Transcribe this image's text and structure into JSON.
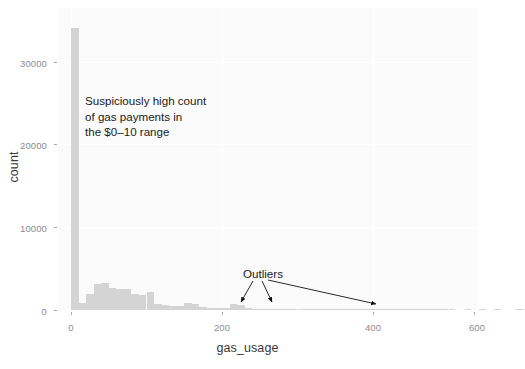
{
  "chart_data": {
    "type": "bar",
    "title": "",
    "subtitle": "",
    "xlabel": "gas_usage",
    "ylabel": "count",
    "xlim": [
      -20,
      620
    ],
    "ylim": [
      0,
      35000
    ],
    "xticks": [
      0,
      200,
      400,
      600
    ],
    "xtick_labels": [
      "0",
      "200",
      "400",
      "600"
    ],
    "yticks": [
      0,
      10000,
      20000,
      30000
    ],
    "ytick_labels": [
      "0",
      "10000",
      "20000",
      "30000"
    ],
    "grid": true,
    "legend": "none",
    "bin_width": 10,
    "bar_color": "#d4d4d4",
    "panel_color": "#fbfbfb",
    "bins": [
      {
        "x": 0,
        "value": 34100
      },
      {
        "x": 10,
        "value": 900
      },
      {
        "x": 20,
        "value": 1900
      },
      {
        "x": 30,
        "value": 3100
      },
      {
        "x": 40,
        "value": 3300
      },
      {
        "x": 50,
        "value": 2700
      },
      {
        "x": 60,
        "value": 2600
      },
      {
        "x": 70,
        "value": 2500
      },
      {
        "x": 80,
        "value": 1900
      },
      {
        "x": 90,
        "value": 1800
      },
      {
        "x": 100,
        "value": 2200
      },
      {
        "x": 110,
        "value": 700
      },
      {
        "x": 120,
        "value": 600
      },
      {
        "x": 130,
        "value": 500
      },
      {
        "x": 140,
        "value": 450
      },
      {
        "x": 150,
        "value": 800
      },
      {
        "x": 160,
        "value": 750
      },
      {
        "x": 170,
        "value": 350
      },
      {
        "x": 180,
        "value": 300
      },
      {
        "x": 190,
        "value": 250
      },
      {
        "x": 200,
        "value": 250
      },
      {
        "x": 210,
        "value": 700
      },
      {
        "x": 220,
        "value": 600
      },
      {
        "x": 230,
        "value": 200
      },
      {
        "x": 240,
        "value": 150
      },
      {
        "x": 250,
        "value": 120
      },
      {
        "x": 260,
        "value": 100
      },
      {
        "x": 270,
        "value": 80
      },
      {
        "x": 280,
        "value": 70
      },
      {
        "x": 290,
        "value": 60
      },
      {
        "x": 300,
        "value": 50
      },
      {
        "x": 310,
        "value": 40
      },
      {
        "x": 320,
        "value": 30
      },
      {
        "x": 330,
        "value": 25
      },
      {
        "x": 340,
        "value": 20
      },
      {
        "x": 350,
        "value": 15
      },
      {
        "x": 360,
        "value": 12
      },
      {
        "x": 370,
        "value": 10
      },
      {
        "x": 380,
        "value": 10
      },
      {
        "x": 390,
        "value": 8
      },
      {
        "x": 400,
        "value": 8
      },
      {
        "x": 410,
        "value": 6
      },
      {
        "x": 420,
        "value": 5
      },
      {
        "x": 430,
        "value": 5
      },
      {
        "x": 440,
        "value": 4
      },
      {
        "x": 450,
        "value": 4
      },
      {
        "x": 460,
        "value": 3
      },
      {
        "x": 470,
        "value": 3
      },
      {
        "x": 480,
        "value": 2
      },
      {
        "x": 490,
        "value": 2
      },
      {
        "x": 500,
        "value": 2
      },
      {
        "x": 520,
        "value": 1
      },
      {
        "x": 540,
        "value": 1
      },
      {
        "x": 560,
        "value": 1
      },
      {
        "x": 590,
        "value": 1
      }
    ],
    "annotations": [
      {
        "name": "high-count-note",
        "text": "Suspiciously high count\nof gas payments in\nthe $0–10 range"
      },
      {
        "name": "outliers-note",
        "text": "Outliers"
      }
    ]
  },
  "axis": {
    "x_title": "gas_usage",
    "y_title": "count",
    "x_tick_labels": [
      "0",
      "200",
      "400",
      "600"
    ],
    "y_tick_labels": [
      "0",
      "10000",
      "20000",
      "30000"
    ]
  },
  "annotations": {
    "high_count": "Suspiciously high count\nof gas payments in\nthe $0–10 range",
    "outliers": "Outliers"
  }
}
